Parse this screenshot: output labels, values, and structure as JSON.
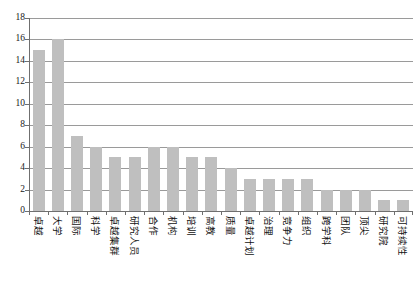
{
  "chart_data": {
    "type": "bar",
    "title": "",
    "subtitle": "",
    "xlabel": "",
    "ylabel": "",
    "ylim": [
      0,
      18
    ],
    "grid": true,
    "legend": "none",
    "orientation": "vertical",
    "bar_color": "#bfbfbf",
    "axis_color": "#6f6f6f",
    "gridline_color": "#9a9a9a",
    "ytick_values": [
      18,
      16,
      14,
      12,
      10,
      8,
      6,
      4,
      2,
      0
    ],
    "ytick_labels": [
      "18",
      "16",
      "14",
      "12",
      "10",
      "8",
      "6",
      "4",
      "2",
      "0"
    ],
    "categories": [
      "卓越",
      "大学",
      "国际",
      "科学",
      "卓越集群",
      "研究人员",
      "合作",
      "机构",
      "培训",
      "高教",
      "质量",
      "卓越计划",
      "治理",
      "竞争力",
      "组织",
      "跨学科",
      "团队",
      "顶尖",
      "研究院",
      "可持续性"
    ],
    "values": [
      15,
      16,
      7,
      6,
      5,
      5,
      6,
      6,
      5,
      5,
      4,
      3,
      3,
      3,
      3,
      2,
      2,
      2,
      1,
      1
    ]
  }
}
